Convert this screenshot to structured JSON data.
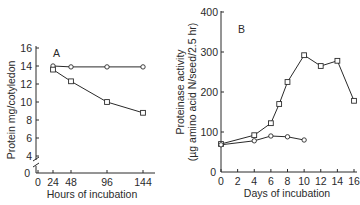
{
  "chart_data": [
    {
      "type": "line",
      "panel_label": "A",
      "title": "",
      "xlabel": "Hours of incubation",
      "ylabel": "Protein mg/cotyledon",
      "x_ticks": [
        "0",
        "24",
        "48",
        "96",
        "144"
      ],
      "y_ticks": [
        "0",
        "4",
        "6",
        "8",
        "10",
        "12",
        "14",
        "16"
      ],
      "ylim": [
        0,
        16
      ],
      "y_axis_break": true,
      "x": [
        24,
        48,
        96,
        144
      ],
      "series": [
        {
          "name": "circles",
          "marker": "circle",
          "values": [
            14.0,
            13.9,
            13.9,
            13.9
          ]
        },
        {
          "name": "squares",
          "marker": "square",
          "values": [
            13.6,
            12.3,
            10.0,
            8.8
          ]
        }
      ],
      "grid": false
    },
    {
      "type": "line",
      "panel_label": "B",
      "title": "",
      "xlabel": "Days of incubation",
      "ylabel": "Proteinase activity (µg amino acid N/seed/2.5 hr)",
      "ylabel_line1": "Proteinase activity",
      "ylabel_line2": "(µg amino acid N/seed/2.5 hr)",
      "x_ticks": [
        "0",
        "2",
        "4",
        "6",
        "8",
        "10",
        "12",
        "14",
        "16"
      ],
      "y_ticks": [
        "0",
        "100",
        "200",
        "300",
        "400"
      ],
      "xlim": [
        0,
        16
      ],
      "ylim": [
        0,
        400
      ],
      "series": [
        {
          "name": "squares",
          "marker": "square",
          "x": [
            0,
            4,
            6,
            7,
            8,
            10,
            12,
            14,
            16
          ],
          "values": [
            70,
            92,
            122,
            170,
            225,
            292,
            265,
            278,
            178
          ]
        },
        {
          "name": "circles",
          "marker": "circle",
          "x": [
            0,
            4,
            6,
            8,
            10
          ],
          "values": [
            68,
            78,
            90,
            88,
            80
          ]
        }
      ],
      "grid": false
    }
  ]
}
